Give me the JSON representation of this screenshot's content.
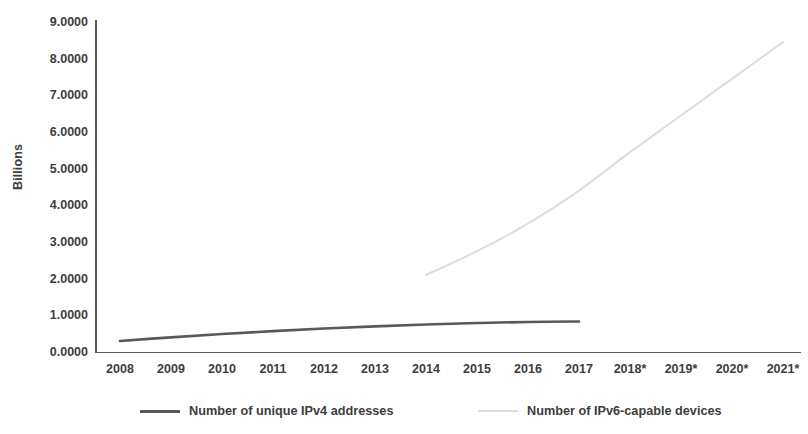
{
  "chart_data": {
    "type": "line",
    "title": "",
    "subtitle": "",
    "xlabel": "",
    "ylabel": "Billions",
    "x": [
      "2008",
      "2009",
      "2010",
      "2011",
      "2012",
      "2013",
      "2014",
      "2015",
      "2016",
      "2017",
      "2018*",
      "2019*",
      "2020*",
      "2021*"
    ],
    "xlim": [
      "2008",
      "2021*"
    ],
    "ylim": [
      0,
      9
    ],
    "ytick_labels": [
      "0.0000",
      "1.0000",
      "2.0000",
      "3.0000",
      "4.0000",
      "5.0000",
      "6.0000",
      "7.0000",
      "8.0000",
      "9.0000"
    ],
    "ytick_values": [
      0,
      1,
      2,
      3,
      4,
      5,
      6,
      7,
      8,
      9
    ],
    "grid": false,
    "legend_position": "bottom",
    "series": [
      {
        "name": "Number of unique IPv4 addresses",
        "color": "#595959",
        "style": "solid",
        "values": [
          0.3,
          0.4,
          0.49,
          0.57,
          0.64,
          0.7,
          0.75,
          0.79,
          0.82,
          0.83,
          null,
          null,
          null,
          null
        ]
      },
      {
        "name": "Number of IPv6-capable devices",
        "color": "#dddddd",
        "style": "solid-faint",
        "values": [
          null,
          null,
          null,
          null,
          null,
          null,
          2.1,
          2.75,
          3.5,
          4.4,
          5.45,
          6.45,
          7.45,
          8.45
        ]
      }
    ]
  },
  "axis": {
    "y_title": "Billions"
  },
  "legend": {
    "items": [
      {
        "label": "Number of unique IPv4 addresses",
        "swatch": "solid-line-swatch"
      },
      {
        "label": "Number of IPv6-capable devices",
        "swatch": "faint-line-swatch"
      }
    ]
  }
}
